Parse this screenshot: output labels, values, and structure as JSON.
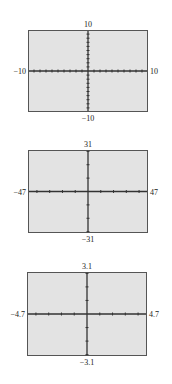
{
  "windows": [
    {
      "name": "standard",
      "xmin": "−10",
      "xmax": "10",
      "ymin": "−10",
      "ymax": "10",
      "xscl": 1,
      "yscl": 1,
      "range": {
        "xmin": -10,
        "xmax": 10,
        "ymin": -10,
        "ymax": 10
      },
      "frame": {
        "left": 28,
        "top": 30,
        "width": 120,
        "height": 82
      }
    },
    {
      "name": "integer",
      "xmin": "−47",
      "xmax": "47",
      "ymin": "−31",
      "ymax": "31",
      "xscl": 10,
      "yscl": 10,
      "range": {
        "xmin": -47,
        "xmax": 47,
        "ymin": -31,
        "ymax": 31
      },
      "frame": {
        "left": 28,
        "top": 150,
        "width": 120,
        "height": 83
      }
    },
    {
      "name": "decimal",
      "xmin": "−4.7",
      "xmax": "4.7",
      "ymin": "−3.1",
      "ymax": "3.1",
      "xscl": 1,
      "yscl": 1,
      "range": {
        "xmin": -4.7,
        "xmax": 4.7,
        "ymin": -3.1,
        "ymax": 3.1
      },
      "frame": {
        "left": 27,
        "top": 272,
        "width": 120,
        "height": 84
      }
    }
  ],
  "colors": {
    "frame_fill": "#e3e3e3",
    "frame_border": "#555555",
    "axis": "#333333"
  }
}
